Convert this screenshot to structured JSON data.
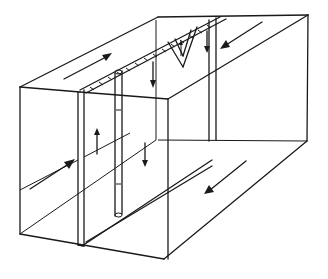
{
  "diagram": {
    "type": "block-diagram",
    "line_color": "#1a1a1a",
    "background": "#ffffff",
    "labels": [],
    "arrows": [
      {
        "id": "top-left-block-motion",
        "direction": "up-right"
      },
      {
        "id": "top-right-block-motion",
        "direction": "down-left"
      },
      {
        "id": "front-left-face-motion",
        "direction": "up-right"
      },
      {
        "id": "bottom-right-face-motion",
        "direction": "down-left"
      },
      {
        "id": "dike-up",
        "direction": "up"
      },
      {
        "id": "dike-down-1",
        "direction": "down"
      },
      {
        "id": "dike-down-2",
        "direction": "down"
      },
      {
        "id": "wedge-up",
        "direction": "up"
      },
      {
        "id": "wedge-down",
        "direction": "down"
      }
    ]
  }
}
